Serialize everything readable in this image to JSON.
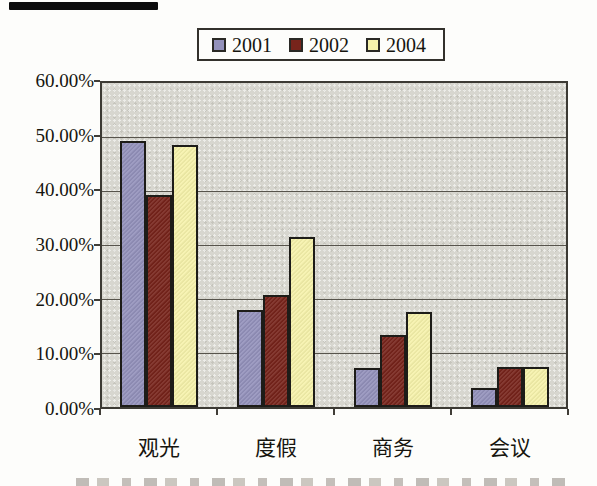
{
  "chart_data": {
    "type": "bar",
    "title": "",
    "xlabel": "",
    "ylabel": "",
    "categories": [
      "观光",
      "度假",
      "商务",
      "会议"
    ],
    "series": [
      {
        "name": "2001",
        "color": "#9391bb",
        "values": [
          49.3,
          18.0,
          7.3,
          3.5
        ]
      },
      {
        "name": "2002",
        "color": "#77241b",
        "values": [
          39.3,
          20.7,
          13.3,
          7.4
        ]
      },
      {
        "name": "2004",
        "color": "#f6f2ab",
        "values": [
          48.6,
          31.4,
          17.6,
          7.4
        ]
      }
    ],
    "ylim": [
      0,
      60
    ],
    "yticks": [
      {
        "value": 0,
        "label": "0.00%"
      },
      {
        "value": 10,
        "label": "10.00%"
      },
      {
        "value": 20,
        "label": "20.00%"
      },
      {
        "value": 30,
        "label": "30.00%"
      },
      {
        "value": 40,
        "label": "40.00%"
      },
      {
        "value": 50,
        "label": "50.00%"
      },
      {
        "value": 60,
        "label": "60.00%"
      }
    ],
    "grid": true,
    "legend_position": "top-center",
    "legend_labels": [
      "2001",
      "2002",
      "2004"
    ],
    "plot_background": "#d7d6cf",
    "gridline_color": "#57544c",
    "bar_border_color": "#1d1c18"
  }
}
